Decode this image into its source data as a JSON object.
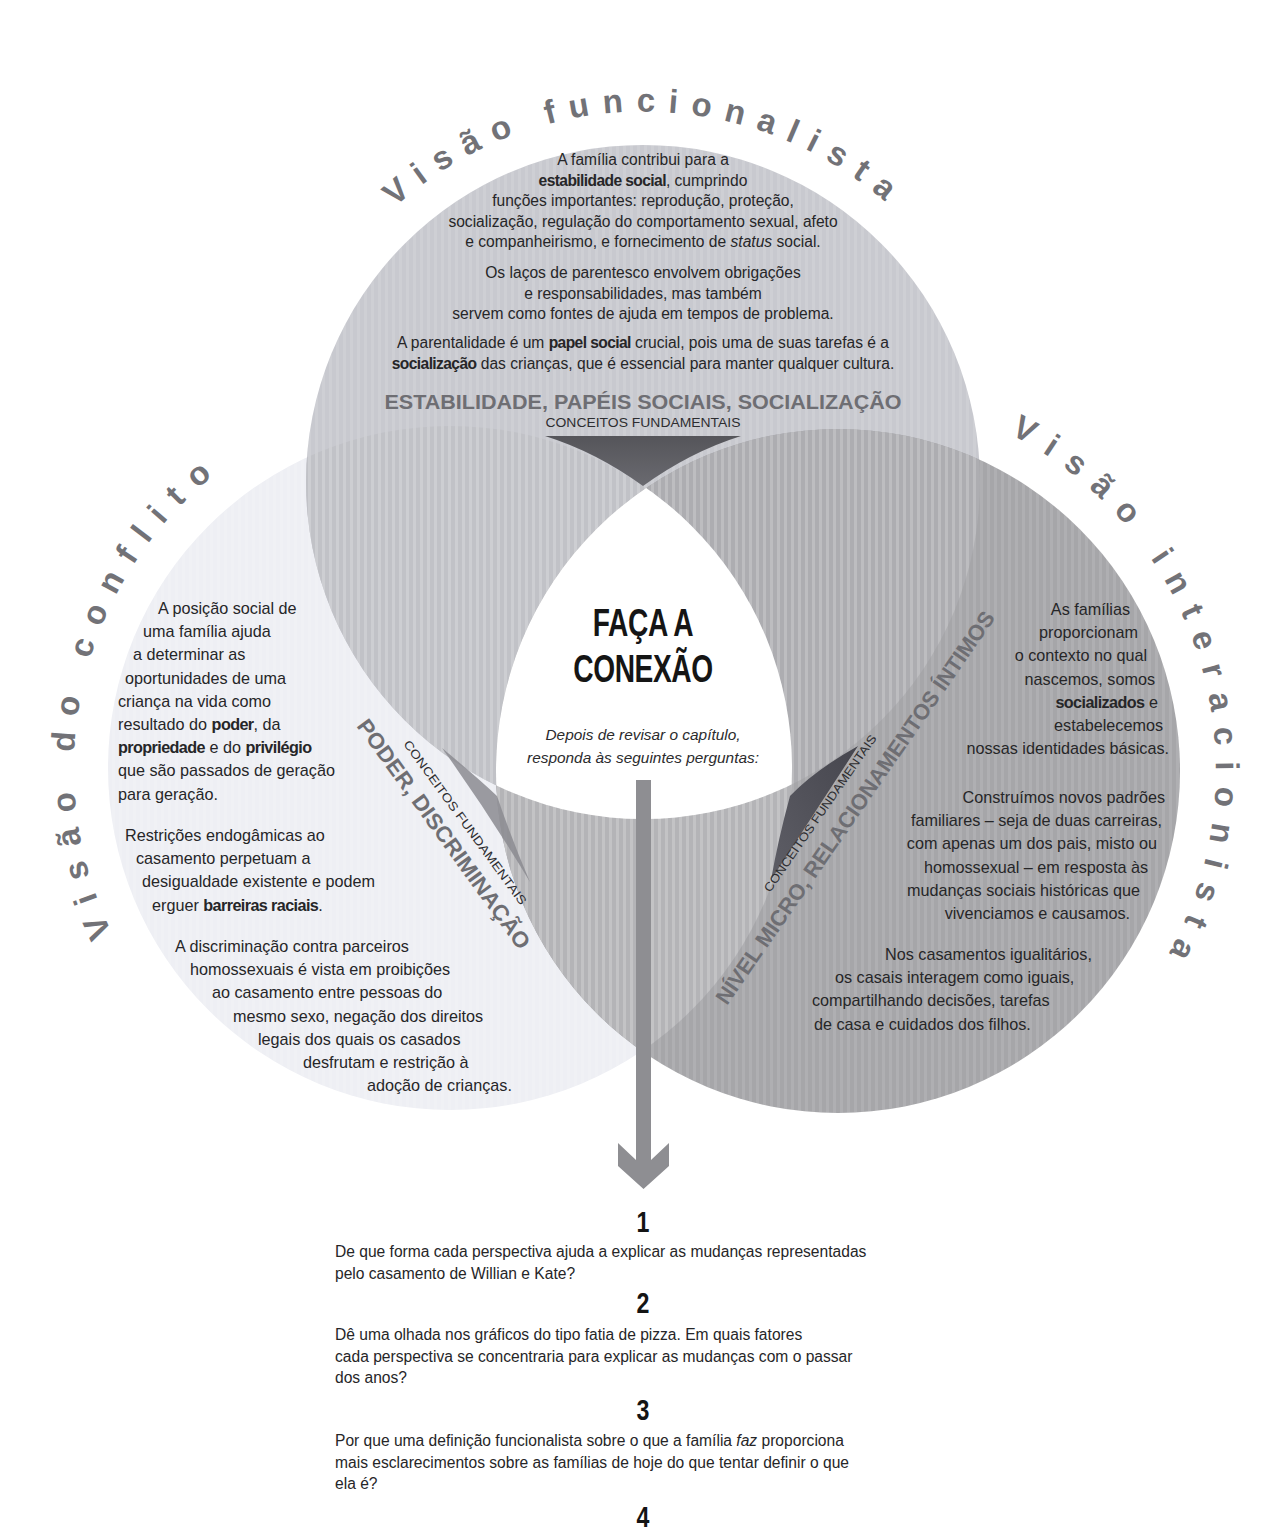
{
  "functionalist": {
    "title": "Visão funcionalista",
    "paragraphs": [
      [
        [
          "A família contribui para a"
        ],
        [
          "estabilidade social",
          ", cumprindo"
        ],
        [
          "funções importantes: reprodução, proteção,"
        ],
        [
          "socialização, regulação do comportamento sexual, afeto"
        ],
        [
          "e companheirismo, e fornecimento de ",
          "status",
          " social."
        ]
      ],
      [
        [
          "Os laços de parentesco envolvem obrigações"
        ],
        [
          "e responsabilidades, mas também"
        ],
        [
          "servem como fontes de ajuda em tempos de problema."
        ]
      ],
      [
        [
          "A parentalidade é um ",
          "papel social",
          " crucial, pois uma de suas tarefas é a"
        ],
        [
          "socialização",
          " das crianças, que é essencial para manter qualquer cultura."
        ]
      ]
    ],
    "key_concepts": "ESTABILIDADE, PAPÉIS SOCIAIS, SOCIALIZAÇÃO",
    "key_concepts_label": "CONCEITOS FUNDAMENTAIS"
  },
  "conflict": {
    "title": "Visão do conflito",
    "paragraphs": [
      [
        [
          "A posição social de"
        ],
        [
          "uma família ajuda"
        ],
        [
          "a determinar as"
        ],
        [
          "oportunidades de uma"
        ],
        [
          "criança na vida como"
        ],
        [
          "resultado do ",
          "poder",
          ", da"
        ],
        [
          "propriedade",
          " e do ",
          "privilégio"
        ],
        [
          "que são passados de geração"
        ],
        [
          "para geração."
        ]
      ],
      [
        [
          "Restrições endogâmicas ao"
        ],
        [
          "casamento perpetuam a"
        ],
        [
          "desigualdade existente e podem"
        ],
        [
          "erguer ",
          "barreiras raciais",
          "."
        ]
      ],
      [
        [
          "A discriminação contra parceiros"
        ],
        [
          "homossexuais é vista em proibições"
        ],
        [
          "ao casamento entre pessoas do"
        ],
        [
          "mesmo sexo, negação dos direitos"
        ],
        [
          "legais dos quais os casados"
        ],
        [
          "desfrutam e restrição à"
        ],
        [
          "adoção de crianças."
        ]
      ]
    ],
    "key_concepts": "PODER, DISCRIMINAÇÃO",
    "key_concepts_label": "CONCEITOS FUNDAMENTAIS"
  },
  "interactionist": {
    "title": "Visão interacionista",
    "paragraphs": [
      [
        [
          "As famílias"
        ],
        [
          "proporcionam"
        ],
        [
          "o contexto no qual"
        ],
        [
          "nascemos, somos"
        ],
        [
          "socializados",
          " e"
        ],
        [
          "estabelecemos"
        ],
        [
          "nossas identidades básicas."
        ]
      ],
      [
        [
          "Construímos novos padrões"
        ],
        [
          "familiares – seja de duas carreiras,"
        ],
        [
          "com apenas um dos pais, misto ou"
        ],
        [
          "homossexual – em resposta às"
        ],
        [
          "mudanças sociais históricas que"
        ],
        [
          "vivenciamos e causamos."
        ]
      ],
      [
        [
          "Nos casamentos igualitários,"
        ],
        [
          "os casais interagem como iguais,"
        ],
        [
          "compartilhando decisões, tarefas"
        ],
        [
          "de casa e cuidados dos filhos."
        ]
      ]
    ],
    "key_concepts": "NÍVEL MICRO, RELACIONAMENTOS ÍNTIMOS",
    "key_concepts_label": "CONCEITOS FUNDAMENTAIS"
  },
  "center": {
    "title_line1": "FAÇA A",
    "title_line2": "CONEXÃO",
    "subtitle_line1": "Depois de revisar o capítulo,",
    "subtitle_line2": "responda às seguintes perguntas:"
  },
  "questions": [
    {
      "number": "1",
      "lines": [
        [
          "De que forma cada perspectiva ajuda a explicar as mudanças representadas"
        ],
        [
          "pelo casamento de Willian e Kate?"
        ]
      ]
    },
    {
      "number": "2",
      "lines": [
        [
          "Dê uma olhada nos gráficos do tipo fatia de pizza. Em quais fatores"
        ],
        [
          "cada perspectiva se concentraria para explicar as mudanças com o passar"
        ],
        [
          "dos anos?"
        ]
      ]
    },
    {
      "number": "3",
      "lines": [
        [
          "Por que uma definição funcionalista sobre o que a família ",
          "faz",
          " proporciona"
        ],
        [
          "mais esclarecimentos sobre as famílias de hoje do que tentar definir o que"
        ],
        [
          "ela é?"
        ]
      ]
    },
    {
      "number": "4",
      "lines": []
    }
  ],
  "colors": {
    "top_circle": "#c8c9cf",
    "left_circle": "#eeeff4",
    "right_circle": "#a6a6a9",
    "top_left_overlap": "#c1c2c7",
    "top_right_overlap": "#adadb1",
    "left_right_overlap": "#b4b4b7",
    "center": "#ffffff",
    "arc_title": "#727277",
    "arrow": "#8e8e92"
  },
  "icons": {
    "arrow": "arrow-down"
  }
}
